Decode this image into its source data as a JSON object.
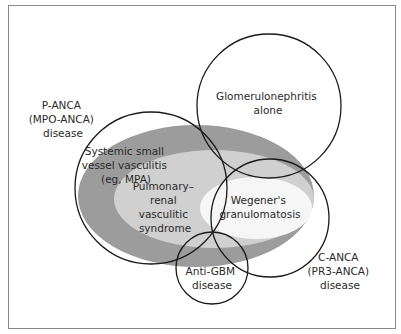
{
  "diagram": {
    "type": "venn",
    "colors": {
      "outer_region": "#9c9c9c",
      "middle_region": "#d0d0d0",
      "inner_region": "#f6f6f6",
      "stroke": "#1a1a1a",
      "frame": "#8a8a8a"
    },
    "regions": [
      {
        "id": "systemic",
        "lines": [
          "Systemic small",
          "vessel vasculitis",
          "(eg, MPA)"
        ]
      },
      {
        "id": "pulmonary",
        "lines": [
          "Pulmonary–",
          "renal",
          "vasculitic",
          "syndrome"
        ]
      },
      {
        "id": "wegener",
        "lines": [
          "Wegener's",
          "granulomatosis"
        ]
      }
    ],
    "circles": [
      {
        "id": "panca",
        "lines": [
          "P-ANCA",
          "(MPO-ANCA)",
          "disease"
        ]
      },
      {
        "id": "glomerulo",
        "lines": [
          "Glomerulonephritis",
          "alone"
        ]
      },
      {
        "id": "canca",
        "lines": [
          "C-ANCA",
          "(PR3-ANCA)",
          "disease"
        ]
      },
      {
        "id": "antigbm",
        "lines": [
          "Anti-GBM",
          "disease"
        ]
      }
    ]
  }
}
